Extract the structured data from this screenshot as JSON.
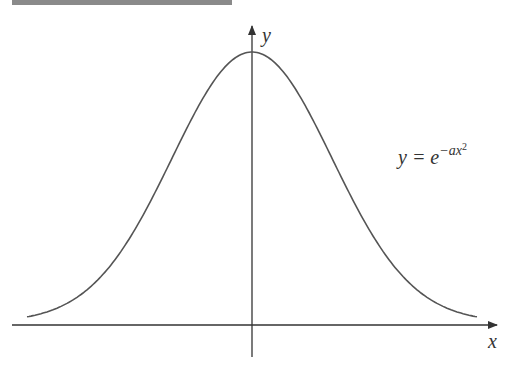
{
  "header_bar": {
    "color": "#8a8a8a"
  },
  "axes": {
    "x_label": "x",
    "y_label": "y",
    "color": "#333333"
  },
  "curve": {
    "color": "#555555",
    "equation": {
      "lhs": "y = e",
      "exponent": "−ax",
      "exponent_power": "2"
    }
  },
  "chart_data": {
    "type": "line",
    "title": "",
    "xlabel": "x",
    "ylabel": "y",
    "function": "y = e^(-a x^2)",
    "x": [
      -3,
      -2.5,
      -2,
      -1.5,
      -1,
      -0.5,
      0,
      0.5,
      1,
      1.5,
      2,
      2.5,
      3
    ],
    "values": [
      0.011,
      0.044,
      0.135,
      0.325,
      0.607,
      0.882,
      1.0,
      0.882,
      0.607,
      0.325,
      0.135,
      0.044,
      0.011
    ],
    "grid": false,
    "legend": "none",
    "annotations": [
      "y = e^{-ax^2}"
    ]
  }
}
